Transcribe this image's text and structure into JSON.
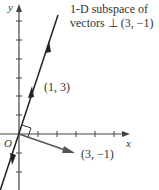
{
  "diagram": {
    "axes": {
      "x_label": "x",
      "y_label": "y",
      "origin_label": "O"
    },
    "line_caption": {
      "line1": "1-D subspace of",
      "line2": "vectors ⊥ (3, −1)"
    },
    "vectors": [
      {
        "label": "(1, 3)",
        "components": [
          1,
          3
        ]
      },
      {
        "label": "(3, −1)",
        "components": [
          3,
          -1
        ]
      }
    ],
    "right_angle_marker": true,
    "colors": {
      "axis": "#444444",
      "line": "#222222",
      "vector": "#555555",
      "text": "#333333"
    }
  }
}
